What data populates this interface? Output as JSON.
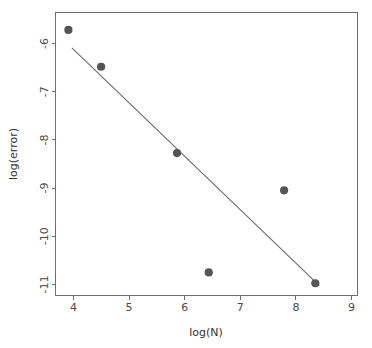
{
  "chart_data": {
    "type": "scatter",
    "title": "",
    "xlabel": "log(N)",
    "ylabel": "log(error)",
    "xlim": [
      3.62,
      9.71
    ],
    "ylim": [
      -11.24,
      -5.24
    ],
    "xticks": [
      4,
      5,
      6,
      7,
      8,
      9
    ],
    "yticks": [
      -6,
      -7,
      -8,
      -9,
      -10,
      -11
    ],
    "xtick_labels": [
      "4",
      "5",
      "6",
      "7",
      "8",
      "9"
    ],
    "ytick_labels": [
      "-6",
      "-7",
      "-8",
      "-9",
      "-10",
      "-11"
    ],
    "grid": false,
    "legend": null,
    "points": [
      {
        "x": 3.88,
        "y": -5.61
      },
      {
        "x": 4.54,
        "y": -6.39
      },
      {
        "x": 6.07,
        "y": -8.22
      },
      {
        "x": 6.71,
        "y": -10.75
      },
      {
        "x": 8.23,
        "y": -9.01
      },
      {
        "x": 8.86,
        "y": -10.98
      }
    ],
    "series": [
      {
        "name": "data",
        "marker": "filled-circle",
        "color": "#555555",
        "x": [
          3.88,
          4.54,
          6.07,
          6.71,
          8.23,
          8.86
        ],
        "values": [
          -5.61,
          -6.39,
          -8.22,
          -10.75,
          -9.01,
          -10.98
        ]
      },
      {
        "name": "fit-line",
        "type": "line",
        "color": "#6b6b6b",
        "x": [
          3.95,
          8.94
        ],
        "values": [
          -5.99,
          -11.03
        ]
      }
    ],
    "point_color": "#555555",
    "line_color": "#6b6b6b",
    "axis_color": "#6e6e6e",
    "background": "#ffffff"
  },
  "axes": {
    "x_title": "log(N)",
    "y_title": "log(error)"
  }
}
